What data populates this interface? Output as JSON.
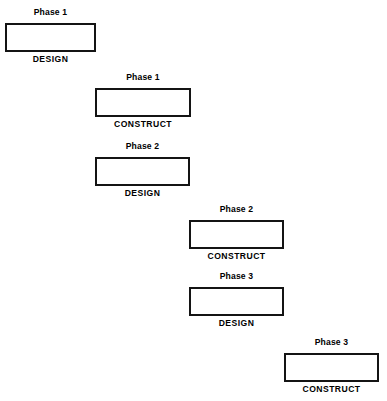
{
  "diagram": {
    "width": 387,
    "height": 401,
    "background_color": "#ffffff",
    "bar_border_color": "#141414",
    "bar_fill_color": "#ffffff",
    "text_color": "#000000",
    "bar_border_width": 2
  },
  "blocks": [
    {
      "id": "phase-1-design",
      "phase_label": "Phase 1",
      "activity_label": "DESIGN",
      "phase": 1,
      "activity": "DESIGN",
      "x": 5,
      "y": 23,
      "width": 91,
      "height": 29,
      "top_label_y": 8,
      "bottom_label_y": 55
    },
    {
      "id": "phase-1-construct",
      "phase_label": "Phase 1",
      "activity_label": "CONSTRUCT",
      "phase": 1,
      "activity": "CONSTRUCT",
      "x": 95,
      "y": 88,
      "width": 96,
      "height": 29,
      "top_label_y": 73,
      "bottom_label_y": 120
    },
    {
      "id": "phase-2-design",
      "phase_label": "Phase 2",
      "activity_label": "DESIGN",
      "phase": 2,
      "activity": "DESIGN",
      "x": 95,
      "y": 157,
      "width": 95,
      "height": 29,
      "top_label_y": 142,
      "bottom_label_y": 189
    },
    {
      "id": "phase-2-construct",
      "phase_label": "Phase 2",
      "activity_label": "CONSTRUCT",
      "phase": 2,
      "activity": "CONSTRUCT",
      "x": 189,
      "y": 220,
      "width": 95,
      "height": 29,
      "top_label_y": 205,
      "bottom_label_y": 252
    },
    {
      "id": "phase-3-design",
      "phase_label": "Phase 3",
      "activity_label": "DESIGN",
      "phase": 3,
      "activity": "DESIGN",
      "x": 189,
      "y": 287,
      "width": 95,
      "height": 29,
      "top_label_y": 272,
      "bottom_label_y": 319
    },
    {
      "id": "phase-3-construct",
      "phase_label": "Phase 3",
      "activity_label": "CONSTRUCT",
      "phase": 3,
      "activity": "CONSTRUCT",
      "x": 284,
      "y": 353,
      "width": 95,
      "height": 29,
      "top_label_y": 338,
      "bottom_label_y": 385
    }
  ]
}
